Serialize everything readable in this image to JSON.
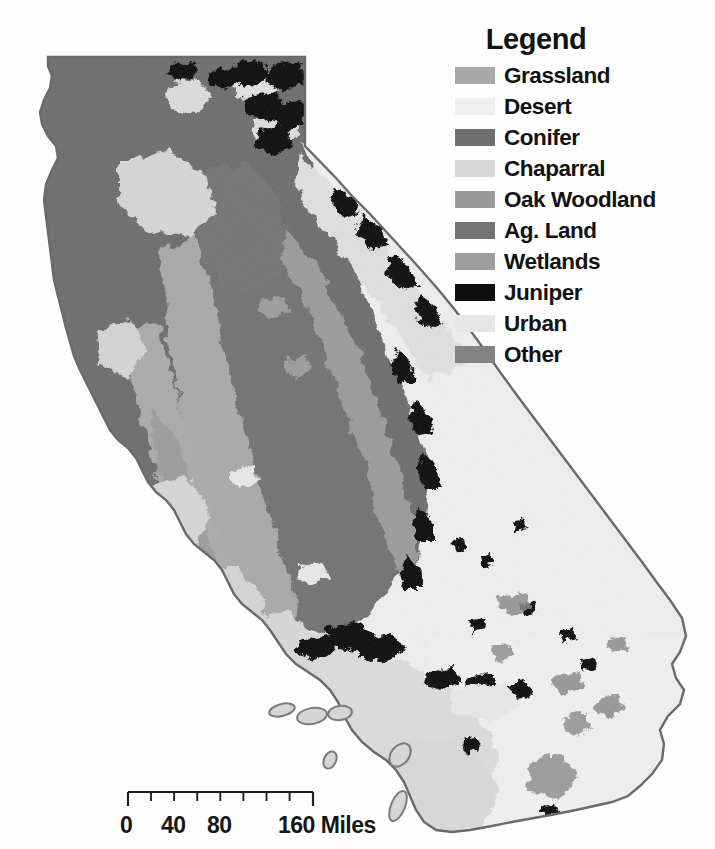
{
  "figure": {
    "kind": "land-cover-map",
    "region": "California",
    "background_color": "#fefefe"
  },
  "legend": {
    "title": "Legend",
    "items": [
      {
        "label": "Grassland",
        "color": "#a9a9a9"
      },
      {
        "label": "Desert",
        "color": "#efefef"
      },
      {
        "label": "Conifer",
        "color": "#6e6e6e"
      },
      {
        "label": "Chaparral",
        "color": "#d8d8d8"
      },
      {
        "label": "Oak Woodland",
        "color": "#9b9b9b"
      },
      {
        "label": "Ag. Land",
        "color": "#737373"
      },
      {
        "label": "Wetlands",
        "color": "#9d9d9d"
      },
      {
        "label": "Juniper",
        "color": "#0d0d0d"
      },
      {
        "label": "Urban",
        "color": "#e6e6e6"
      },
      {
        "label": "Other",
        "color": "#828282"
      }
    ]
  },
  "scalebar": {
    "labels": [
      "0",
      "40",
      "80",
      "160 Miles"
    ],
    "label_positions_px": [
      10,
      56,
      102,
      180
    ],
    "unit": "Miles",
    "max_value": 160,
    "tick_count": 9,
    "bar_length_px": 185,
    "line_color": "#1f1f1f"
  },
  "map": {
    "outline_color": "#6a6a6a",
    "ocean_color": "#fefefe",
    "classes": {
      "grassland": "#a9a9a9",
      "desert": "#efefef",
      "conifer": "#6e6e6e",
      "chaparral": "#d8d8d8",
      "oak_woodland": "#9b9b9b",
      "ag_land": "#737373",
      "wetlands": "#9d9d9d",
      "juniper": "#0d0d0d",
      "urban": "#e6e6e6",
      "other": "#828282"
    },
    "regions": [
      {
        "name": "north-coast-conifer",
        "class": "conifer"
      },
      {
        "name": "northeast-juniper",
        "class": "juniper"
      },
      {
        "name": "central-valley-ag",
        "class": "ag_land"
      },
      {
        "name": "sierra-nevada-conifer",
        "class": "conifer"
      },
      {
        "name": "coast-range-grassland",
        "class": "grassland"
      },
      {
        "name": "mojave-desert",
        "class": "desert"
      },
      {
        "name": "sonoran-desert",
        "class": "desert"
      },
      {
        "name": "southcoast-chaparral",
        "class": "chaparral"
      },
      {
        "name": "channel-islands",
        "class": "chaparral"
      }
    ]
  }
}
